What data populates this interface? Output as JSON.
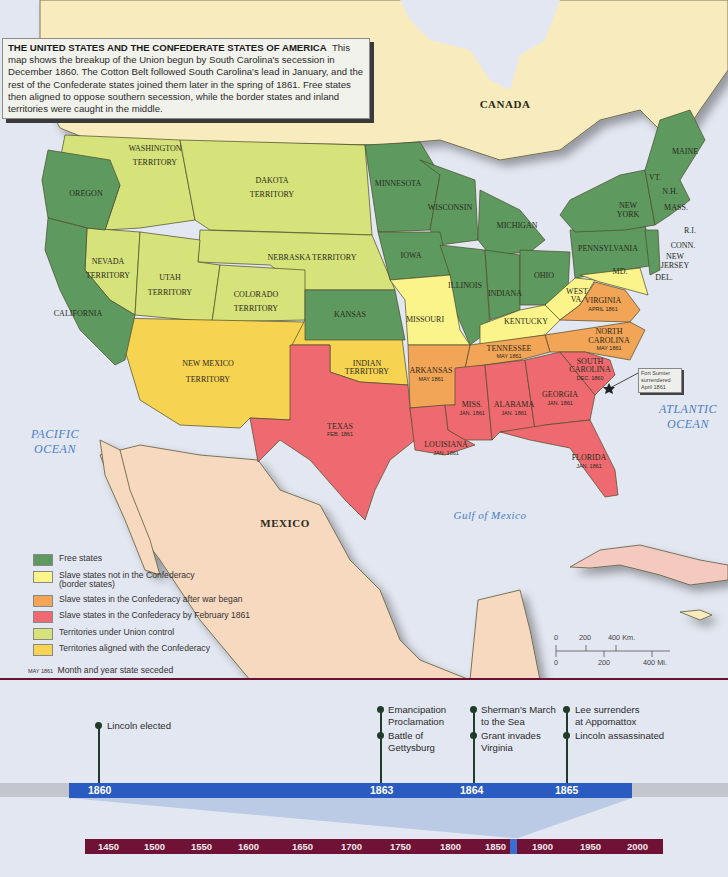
{
  "caption": {
    "title": "THE UNITED STATES AND THE CONFEDERATE STATES OF AMERICA",
    "body": "This map shows the breakup of the Union begun by South Carolina's secession in December 1860. The Cotton Belt followed South Carolina's lead in January, and the rest of the Confederate states joined them later in the spring of 1861. Free states then aligned to oppose southern secession, while the border states and inland territories were caught in the middle."
  },
  "colors": {
    "free": "#5e9a60",
    "border": "#fbf48a",
    "after_war": "#f2a457",
    "by_feb_1861": "#ee6a70",
    "union_territory": "#d6e27a",
    "confed_territory": "#f7d352",
    "canada": "#f8ebbd",
    "mexico": "#f7d9c0",
    "water": "#e3e7f1",
    "timeline_blue": "#2a5bc0",
    "era_bar": "#6f1235"
  },
  "map": {
    "countries": {
      "canada": "CANADA",
      "mexico": "MEXICO"
    },
    "oceans": {
      "pacific_1": "PACIFIC",
      "pacific_2": "OCEAN",
      "atlantic_1": "ATLANTIC",
      "atlantic_2": "OCEAN",
      "gulf": "Gulf of Mexico"
    },
    "free_states": [
      "OREGON",
      "CALIFORNIA",
      "MINNESOTA",
      "WISCONSIN",
      "MICHIGAN",
      "IOWA",
      "ILLINOIS",
      "INDIANA",
      "OHIO",
      "PENNSYLVANIA",
      "NEW YORK",
      "KANSAS",
      "MAINE",
      "VT.",
      "N.H.",
      "MASS.",
      "R.I.",
      "CONN.",
      "NEW JERSEY"
    ],
    "labels": {
      "washington_1": "WASHINGTON",
      "washington_2": "TERRITORY",
      "dakota_1": "DAKOTA",
      "dakota_2": "TERRITORY",
      "oregon": "OREGON",
      "nebraska": "NEBRASKA TERRITORY",
      "nevada_1": "NEVADA",
      "nevada_2": "TERRITORY",
      "utah_1": "UTAH",
      "utah_2": "TERRITORY",
      "colorado_1": "COLORADO",
      "colorado_2": "TERRITORY",
      "california": "CALIFORNIA",
      "kansas": "KANSAS",
      "newmexico_1": "NEW MEXICO",
      "newmexico_2": "TERRITORY",
      "indian_1": "INDIAN",
      "indian_2": "TERRITORY",
      "minnesota": "MINNESOTA",
      "wisconsin": "WISCONSIN",
      "michigan": "MICHIGAN",
      "iowa": "IOWA",
      "illinois": "ILLINOIS",
      "indiana": "INDIANA",
      "ohio": "OHIO",
      "pennsylvania": "PENNSYLVANIA",
      "newyork_1": "NEW",
      "newyork_2": "YORK",
      "maine": "MAINE",
      "vt": "VT.",
      "nh": "N.H.",
      "mass": "MASS.",
      "ri": "R.I.",
      "conn": "CONN.",
      "newjersey_1": "NEW",
      "newjersey_2": "JERSEY",
      "md": "MD.",
      "del": "DEL.",
      "westva_1": "WEST",
      "westva_2": "VA.",
      "missouri": "MISSOURI",
      "kentucky": "KENTUCKY"
    },
    "seceded": [
      {
        "key": "virginia",
        "name": "VIRGINIA",
        "date": "April 1861"
      },
      {
        "key": "northcarolina",
        "name": "NORTH CAROLINA",
        "date": "May 1861"
      },
      {
        "key": "tennessee",
        "name": "TENNESSEE",
        "date": "May 1861"
      },
      {
        "key": "arkansas",
        "name": "ARKANSAS",
        "date": "May 1861"
      },
      {
        "key": "southcarolina",
        "name": "SOUTH CAROLINA",
        "date": "Dec. 1860"
      },
      {
        "key": "georgia",
        "name": "GEORGIA",
        "date": "Jan. 1861"
      },
      {
        "key": "alabama",
        "name": "ALABAMA",
        "date": "Jan. 1861"
      },
      {
        "key": "mississippi",
        "name": "MISS.",
        "date": "Jan. 1861"
      },
      {
        "key": "louisiana",
        "name": "LOUISIANA",
        "date": "Jan. 1861"
      },
      {
        "key": "florida",
        "name": "FLORIDA",
        "date": "Jan. 1861"
      },
      {
        "key": "texas",
        "name": "TEXAS",
        "date": "Feb. 1861"
      }
    ],
    "s": {
      "va_n": "VIRGINIA",
      "va_d": "APRIL 1861",
      "nc_n1": "NORTH",
      "nc_n2": "CAROLINA",
      "nc_d": "MAY 1861",
      "tn_n": "TENNESSEE",
      "tn_d": "MAY 1861",
      "ar_n": "ARKANSAS",
      "ar_d": "MAY 1861",
      "sc_n1": "SOUTH",
      "sc_n2": "CAROLINA",
      "sc_d": "DEC. 1860",
      "ga_n": "GEORGIA",
      "ga_d": "JAN. 1861",
      "al_n": "ALABAMA",
      "al_d": "JAN. 1861",
      "ms_n": "MISS.",
      "ms_d": "JAN. 1861",
      "la_n": "LOUISIANA",
      "la_d": "JAN. 1861",
      "fl_n": "FLORIDA",
      "fl_d": "JAN. 1861",
      "tx_n": "TEXAS",
      "tx_d": "FEB. 1861"
    },
    "fort_sumter": {
      "line1": "Fort Sumter",
      "line2": "surrendered",
      "line3": "April 1861"
    }
  },
  "legend": {
    "items": [
      {
        "key": "free",
        "label": "Free states"
      },
      {
        "key": "border",
        "label": "Slave states not in the Confederacy",
        "label2": "(border states)"
      },
      {
        "key": "after_war",
        "label": "Slave states in the Confederacy after war began"
      },
      {
        "key": "by_feb_1861",
        "label": "Slave states in the Confederacy by February 1861"
      },
      {
        "key": "union_territory",
        "label": "Territories under Union control"
      },
      {
        "key": "confed_territory",
        "label": "Territories aligned with the Confederacy"
      }
    ],
    "note_sample": "MAY 1861",
    "note_text": "Month and year state seceded"
  },
  "scale": {
    "km": [
      "0",
      "200",
      "400 Km."
    ],
    "mi": [
      "0",
      "200",
      "400 Mi."
    ]
  },
  "timeline": {
    "years": [
      "1860",
      "1863",
      "1864",
      "1865"
    ],
    "events": [
      {
        "year": "1860",
        "lines": [
          "Lincoln elected"
        ]
      },
      {
        "year": "1863",
        "lines": [
          "Emancipation",
          "Proclamation"
        ]
      },
      {
        "year": "1863",
        "lines": [
          "Battle of",
          "Gettysburg"
        ]
      },
      {
        "year": "1864",
        "lines": [
          "Sherman's March",
          "to the Sea"
        ]
      },
      {
        "year": "1864",
        "lines": [
          "Grant invades",
          "Virginia"
        ]
      },
      {
        "year": "1865",
        "lines": [
          "Lee surrenders",
          "at Appomattox"
        ]
      },
      {
        "year": "1865",
        "lines": [
          "Lincoln assassinated"
        ]
      }
    ],
    "era": [
      "1450",
      "1500",
      "1550",
      "1600",
      "1650",
      "1700",
      "1750",
      "1800",
      "1850",
      "1900",
      "1950",
      "2000"
    ],
    "era_highlight": "1860-1865"
  }
}
